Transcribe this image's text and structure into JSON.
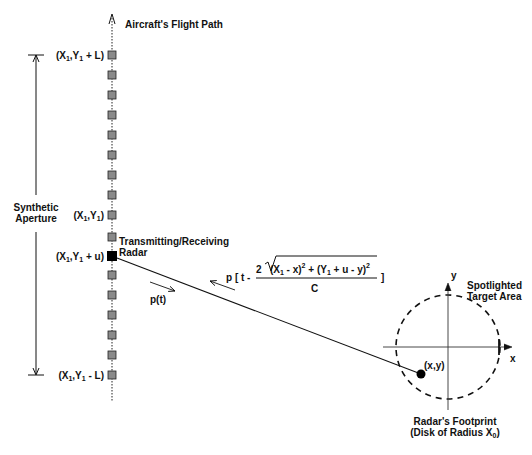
{
  "diagram": {
    "flight_path_label": "Aircraft's Flight Path",
    "aperture_label_line1": "Synthetic",
    "aperture_label_line2": "Aperture",
    "positions": {
      "top": {
        "prefix": "(X",
        "sub": "1",
        "mid": ",Y",
        "sub2": "1",
        "suffix": " + L)"
      },
      "center": {
        "prefix": "(X",
        "sub": "1",
        "mid": ",Y",
        "sub2": "1",
        "suffix": ")"
      },
      "current": {
        "prefix": "(X",
        "sub": "1",
        "mid": ",Y",
        "sub2": "1",
        "suffix": " + u)"
      },
      "bottom": {
        "prefix": "(X",
        "sub": "1",
        "mid": ",Y",
        "sub2": "1",
        "suffix": " - L)"
      }
    },
    "radar_label_line1": "Transmitting/Receiving",
    "radar_label_line2": "Radar",
    "transmit_signal": "p(t)",
    "echo_signal": {
      "lead": "p [ t -",
      "coef": "2",
      "term1_a": "(X",
      "term1_sub": "1",
      "term1_b": " - x)",
      "sq": "2",
      "plus": " + (Y",
      "term2_sub": "1",
      "term2_b": " + u - y)",
      "sq2": "2",
      "denominator": "C",
      "close": "]"
    },
    "target_label_line1": "Spotlighted",
    "target_label_line2": "Target Area",
    "axis_x": "x",
    "axis_y": "y",
    "target_point": "(x,y)",
    "footprint_line1": "Radar's Footprint",
    "footprint_line2_prefix": "(Disk of Radius  X",
    "footprint_line2_sub": "0",
    "footprint_line2_suffix": ")",
    "marker_ys": [
      55,
      75,
      95,
      115,
      135,
      155,
      175,
      195,
      215,
      237,
      275,
      295,
      315,
      335,
      355,
      375
    ],
    "active_marker_y": 256,
    "colors": {
      "ink": "#111111",
      "marker_fill": "#8a8a8a",
      "active_marker": "#000000"
    }
  }
}
